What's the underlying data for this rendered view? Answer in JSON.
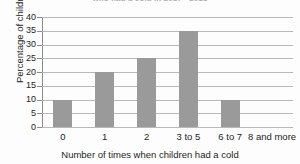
{
  "chart_data": {
    "type": "bar",
    "title": "who had a cold in 2017 - 2018",
    "xlabel": "Number of times when children had a cold",
    "ylabel": "Percentage of children",
    "categories": [
      "0",
      "1",
      "2",
      "3 to 5",
      "6 to 7",
      "8 and more"
    ],
    "values": [
      10,
      20,
      25,
      35,
      10,
      0
    ],
    "ylim": [
      0,
      40
    ],
    "yticks": [
      0,
      5,
      10,
      15,
      20,
      25,
      30,
      35,
      40
    ],
    "ytick_labels": [
      "0",
      "5",
      "10",
      "15",
      "20",
      "25",
      "30",
      "35",
      "40"
    ],
    "grid": true,
    "legend": false,
    "bar_color": "#9a9a9a",
    "gridline_color": "#b9b9b9",
    "axis_color": "#8b8b8b",
    "text_color": "#231f20",
    "background_color": "#fdfdfd"
  }
}
